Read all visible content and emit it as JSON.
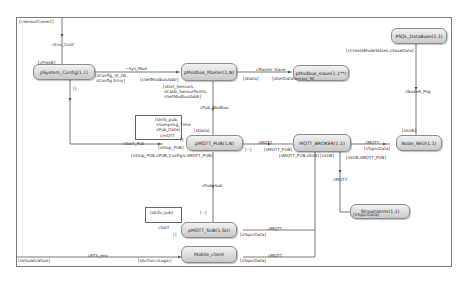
{
  "diagram": {
    "nodes": [
      {
        "id": "system_config",
        "label": "pSystem_Config(1,1)"
      },
      {
        "id": "modbus_master",
        "label": "pModbus_Master(1,N)"
      },
      {
        "id": "modbus_slave",
        "label": "pModbus_slave(1,1**)"
      },
      {
        "id": "psql_database",
        "label": "PSQL_DataBase(1,1)"
      },
      {
        "id": "mqtt_pub",
        "label": "pMQTT_PUB(1,N)"
      },
      {
        "id": "mqtt_broker",
        "label": "MQTT_BROKER(1,1)"
      },
      {
        "id": "node_red",
        "label": "Node_RED(1,1)"
      },
      {
        "id": "mqtt_sub",
        "label": "pMQTT_SUB(1,SU)"
      },
      {
        "id": "streamlents",
        "label": "Streamlents(1,1)"
      },
      {
        "id": "mobile_client",
        "label": "Mobile_client"
      }
    ],
    "labels": {
      "sensor_conect": "[cSensorConect]",
      "env_conf": "cEnv_Conf",
      "preset": "[cPresB]",
      "sys_mod": "~Sys_Mod",
      "config_st": "[sConfig_St_Ok,\n sConfig Error]",
      "set_modbus_addr": "[cSetModbusAddr]",
      "get_sensors": "[sGet_Sensors,\n sCalib_SensorPoints,\n sSetModbusAddr]",
      "master_slave": "cMaster Slave",
      "sdata_master": "[sData]",
      "get_datasensor": "[sGetDataSensor_N]",
      "create_mode_tables": "[cCreateModeTables,sSaveData]",
      "node_psq": "cNodeR_Psq",
      "empty_brackets": "[]",
      "pub_modbus": "cPub_Modbus",
      "sinfo_pub": "[sInfo_pub,\n sSampling_Time\n sPub_Data]",
      "sdata_pub": "[sData]",
      "cmqtt_pub_loop": "cmQTT",
      "empty_pub": "[]",
      "start_pub": "cStart_Pub",
      "stop_pub": "[sStop_PUB]",
      "stop_pub_config": "[sStop_PUB,sPUB_ConfigS,sMQTT_PUB]",
      "dash": "[--]",
      "cmqtt_a": "cMQTT",
      "mqtt_pub_in": "[sMQTT_PUB]",
      "mqtt_pub_sub": "[sMQTT_PUB,sSUB]",
      "sub_b": "[sSUB]",
      "sub_mqtt_pub": "[sSUB,sMQTT_PUB]",
      "cmqtt_b": "cMQTT",
      "topic_data_nr": "[sTopicData]",
      "sub_nr": "[sSUB]",
      "cmqtt_c": "cMQTT",
      "topic_data_sl": "[sTopicData]",
      "pub_sub": "cPub_Sub",
      "sinfo_sub": "[sInfo_sub]",
      "dash_sub": "[--]",
      "cmqtt_sub_loop": "cSalT",
      "empty_sub": "[]",
      "topic_data_sub": "[sTopicData]",
      "cmqtt_d": "cMQTT",
      "rts_env": "cRTS_env",
      "visualization": "[sVisualization]",
      "action_login": "[sAction,sLogin]",
      "topic_data_mc": "[sTopicData]",
      "cmqtt_e": "cMQTT"
    }
  }
}
